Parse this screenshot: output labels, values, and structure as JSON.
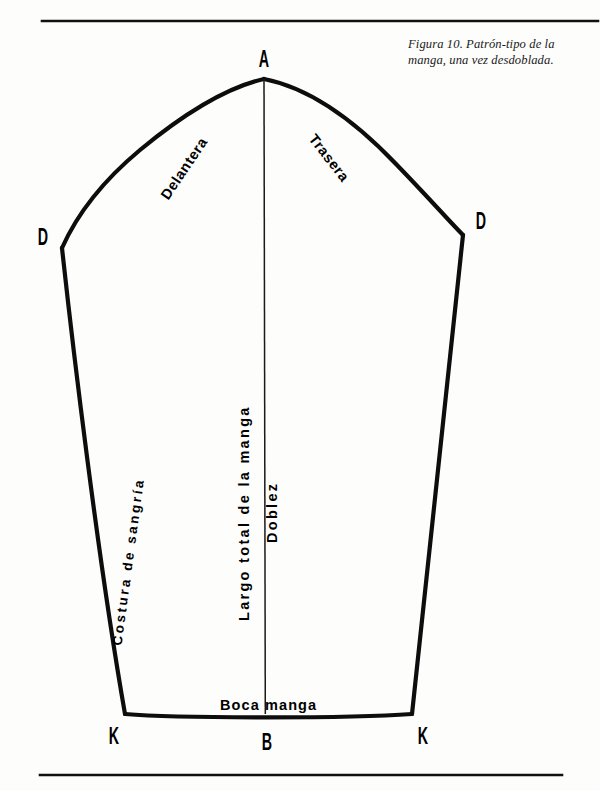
{
  "page": {
    "width": 600,
    "height": 791,
    "background_color": "#fdfdfc",
    "ink_color": "#000000"
  },
  "caption": {
    "text": "Figura 10.  Patrón-tipo de la manga, una vez desdoblada.",
    "figure_number": "Figura 10.",
    "body": "Patrón-tipo de la manga, una vez desdoblada."
  },
  "rules": {
    "top_rule": {
      "x1": 42,
      "y": 21,
      "x2": 598,
      "thickness": 2.6
    },
    "bottom_rule": {
      "x1": 40,
      "y": 775,
      "x2": 562,
      "thickness": 2.6
    }
  },
  "point_labels": [
    {
      "id": "A",
      "text": "A",
      "x": 264,
      "y": 60
    },
    {
      "id": "D-left",
      "text": "D",
      "x": 43,
      "y": 238
    },
    {
      "id": "D-right",
      "text": "D",
      "x": 481,
      "y": 222
    },
    {
      "id": "K-left",
      "text": "K",
      "x": 114,
      "y": 737
    },
    {
      "id": "B",
      "text": "B",
      "x": 267,
      "y": 743
    },
    {
      "id": "K-right",
      "text": "K",
      "x": 423,
      "y": 737
    }
  ],
  "seam_labels": [
    {
      "id": "delantera",
      "text": "Delantera",
      "rotation_deg": -56
    },
    {
      "id": "trasera",
      "text": "Trasera",
      "rotation_deg": 52
    },
    {
      "id": "costura-de-sangria",
      "text": "Costura de sangría",
      "rotation_deg": -82
    },
    {
      "id": "largo-total-de-la-manga",
      "text": "Largo total de la manga",
      "rotation_deg": -90
    },
    {
      "id": "doblez",
      "text": "Doblez",
      "rotation_deg": -90
    },
    {
      "id": "boca-manga",
      "text": "Boca manga",
      "rotation_deg": 0
    }
  ],
  "pattern_geometry": {
    "outline_stroke_width": 4.2,
    "fold_line_stroke_width": 1.5,
    "apex": {
      "x": 264,
      "y": 79
    },
    "left_shoulder": {
      "x": 62,
      "y": 248
    },
    "right_shoulder": {
      "x": 463,
      "y": 235
    },
    "left_hem": {
      "x": 125,
      "y": 714
    },
    "right_hem": {
      "x": 412,
      "y": 714
    },
    "hem_mid": {
      "x": 267,
      "y": 716
    },
    "cap_curve_front_d": "M 62 248 C 78 212 104 180 140 150 C 180 117 224 88 264 79",
    "cap_curve_back_d": "M 264 79 C 310 88 356 122 396 164 C 428 197 450 222 463 235",
    "left_seam_d": "M 62 248 C 72 340 98 560 125 714",
    "right_seam_d": "M 463 235 C 452 330 428 570 412 714",
    "hem_d": "M 125 714 C 180 718 350 718 412 714",
    "fold_line_d": "M 264 79 L 265 714"
  }
}
